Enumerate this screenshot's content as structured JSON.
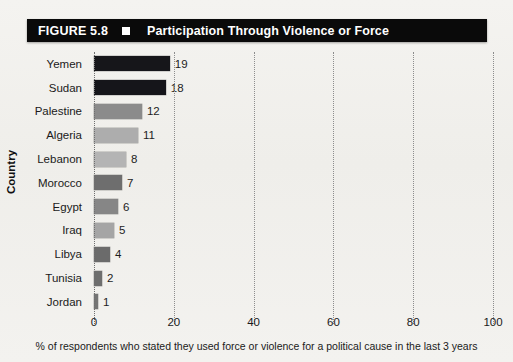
{
  "figure": {
    "number_label": "FIGURE 5.8",
    "title": "Participation Through Violence or Force",
    "marker_icon": "white-square-icon",
    "bar_color": "#0a0a0a",
    "text_color": "#ffffff"
  },
  "chart_data": {
    "type": "bar",
    "orientation": "horizontal",
    "title": "Participation Through Violence or Force",
    "xlabel": "% of respondents who stated they used force or violence for a political cause in the last 3 years",
    "ylabel": "Country",
    "categories": [
      "Yemen",
      "Sudan",
      "Palestine",
      "Algeria",
      "Lebanon",
      "Morocco",
      "Egypt",
      "Iraq",
      "Libya",
      "Tunisia",
      "Jordan"
    ],
    "values": [
      19,
      18,
      12,
      11,
      8,
      7,
      6,
      5,
      4,
      2,
      1
    ],
    "value_labels": [
      "19",
      "18",
      "12",
      "11",
      "8",
      "7",
      "6",
      "5",
      "4",
      "2",
      "1"
    ],
    "bar_colors": [
      "#16161a",
      "#15151a",
      "#8b8b8b",
      "#adadad",
      "#b4b4b4",
      "#6e6e6e",
      "#868686",
      "#a5a5a5",
      "#6b6b6b",
      "#6e6e6e",
      "#747474"
    ],
    "xlim": [
      0,
      100
    ],
    "xticks": [
      0,
      20,
      40,
      60,
      80,
      100
    ],
    "xtick_labels": [
      "0",
      "20",
      "40",
      "60",
      "80",
      "100"
    ],
    "grid": true,
    "grid_style": "dotted-vertical",
    "legend": null
  },
  "axis": {
    "y_title": "Country",
    "x_caption": "% of respondents who stated they used force or violence for a political cause in the last 3 years"
  }
}
